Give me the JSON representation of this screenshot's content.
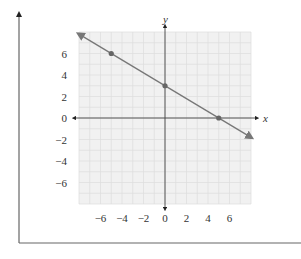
{
  "chart_data": {
    "type": "line",
    "title": "",
    "xlabel": "x",
    "ylabel": "y",
    "xlim": [
      -8,
      8
    ],
    "ylim": [
      -8,
      8
    ],
    "grid": true,
    "x_ticks": [
      -6,
      -4,
      -2,
      0,
      2,
      4,
      6
    ],
    "y_ticks": [
      6,
      4,
      2,
      0,
      -2,
      -4,
      -6
    ],
    "x_tick_labels": [
      "−6",
      "−4",
      "−2",
      "0",
      "2",
      "4",
      "6"
    ],
    "y_tick_labels": [
      "6",
      "4",
      "2",
      "0",
      "−2",
      "−4",
      "−6"
    ],
    "series": [
      {
        "name": "line",
        "equation": "y = -3/5 x + 3",
        "slope": -0.6,
        "intercept": 3,
        "x": [
          -8,
          8
        ],
        "y": [
          7.8,
          -1.8
        ],
        "arrows_both_ends": true
      }
    ],
    "points": [
      {
        "x": -5,
        "y": 6
      },
      {
        "x": 0,
        "y": 3
      },
      {
        "x": 5,
        "y": 0
      }
    ]
  },
  "colors": {
    "grid_bg": "#f1f1f1",
    "grid_line": "#dcdcdc",
    "axis": "#444444",
    "line": "#777777",
    "point": "#666666",
    "frame": "#666666"
  }
}
